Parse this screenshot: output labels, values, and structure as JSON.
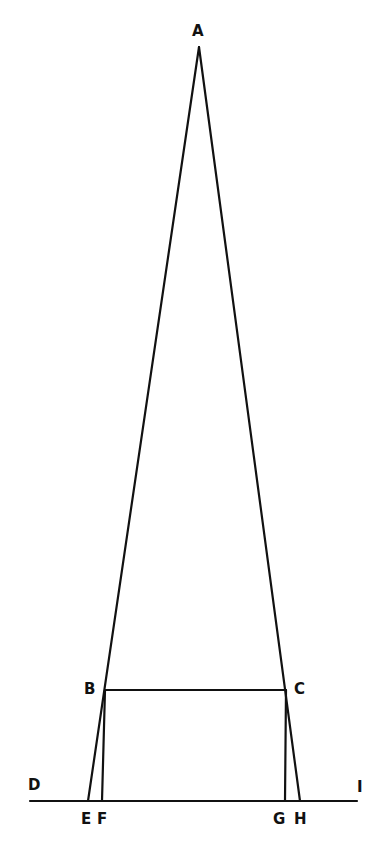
{
  "diagram": {
    "type": "geometric-construction",
    "colors": {
      "stroke": "#111111",
      "background": "#ffffff"
    },
    "points": {
      "A": {
        "x": 199,
        "y": 47
      },
      "B": {
        "x": 105,
        "y": 690
      },
      "C": {
        "x": 286,
        "y": 690
      },
      "D": {
        "x": 30,
        "y": 801
      },
      "E": {
        "x": 88,
        "y": 801
      },
      "F": {
        "x": 102,
        "y": 801
      },
      "G": {
        "x": 285,
        "y": 801
      },
      "H": {
        "x": 300,
        "y": 801
      },
      "I": {
        "x": 357,
        "y": 801
      }
    },
    "labels": [
      {
        "text": "A",
        "x": 192,
        "y": 36
      },
      {
        "text": "B",
        "x": 84,
        "y": 694
      },
      {
        "text": "C",
        "x": 294,
        "y": 694
      },
      {
        "text": "D",
        "x": 28,
        "y": 790
      },
      {
        "text": "I",
        "x": 357,
        "y": 792
      },
      {
        "text": "E",
        "x": 81,
        "y": 824
      },
      {
        "text": "F",
        "x": 97,
        "y": 824
      },
      {
        "text": "G",
        "x": 273,
        "y": 824
      },
      {
        "text": "H",
        "x": 294,
        "y": 824
      }
    ],
    "segments": [
      [
        "A",
        "E"
      ],
      [
        "A",
        "H"
      ],
      [
        "B",
        "C"
      ],
      [
        "B",
        "F"
      ],
      [
        "C",
        "G"
      ],
      [
        "D",
        "I"
      ]
    ]
  }
}
